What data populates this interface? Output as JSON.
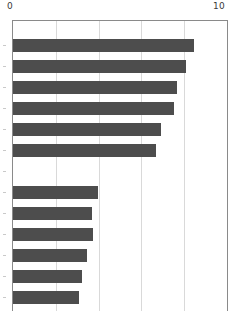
{
  "chart_data": {
    "type": "bar",
    "orientation": "horizontal",
    "title": "",
    "xlabel": "",
    "ylabel": "",
    "xlim": [
      0,
      10
    ],
    "ylim": null,
    "grid": true,
    "legend": null,
    "bar_color": "#4d4d4d",
    "gridline_color": "#d9d9d9",
    "axis_color": "#8a8a8a",
    "axis_position": "top",
    "categories": [
      "",
      "",
      "",
      "",
      "",
      "",
      "",
      "",
      "",
      "",
      "",
      "",
      ""
    ],
    "values": [
      8.46,
      8.08,
      7.66,
      7.52,
      6.92,
      6.68,
      0,
      3.97,
      3.69,
      3.74,
      3.46,
      3.22,
      3.08
    ],
    "tick_labels": [
      "0",
      "10"
    ],
    "tick_values": [
      0,
      10
    ],
    "gridline_values": [
      2,
      4,
      6,
      8
    ]
  },
  "axis": {
    "left_label": "0",
    "right_label": "10"
  }
}
